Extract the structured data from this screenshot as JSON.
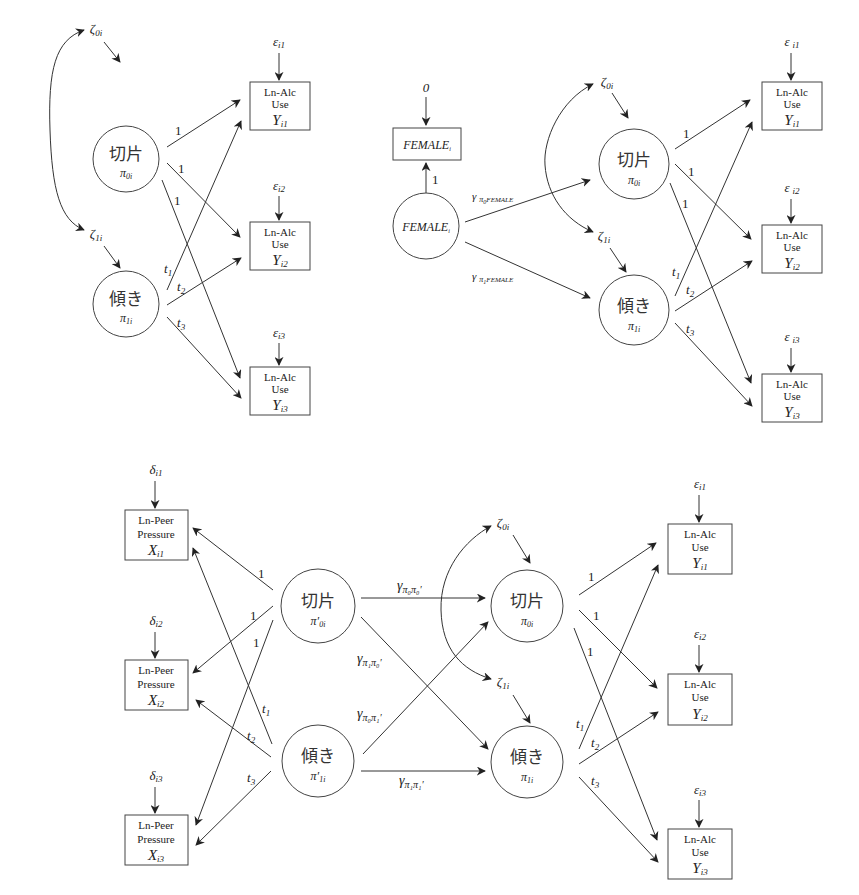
{
  "figure": {
    "panels": [
      {
        "id": "unconditional",
        "latents": [
          {
            "id": "intercept",
            "label": "切片",
            "symbol": "π",
            "sub": "0i",
            "disturbance": {
              "symbol": "ζ",
              "sub": "0i"
            }
          },
          {
            "id": "slope",
            "label": "傾き",
            "symbol": "π",
            "sub": "1i",
            "disturbance": {
              "symbol": "ζ",
              "sub": "1i"
            }
          }
        ],
        "observed": [
          {
            "id": "y1",
            "lines": [
              "Ln-Alc",
              "Use"
            ],
            "symbol": "Y",
            "sub": "i1",
            "error": {
              "symbol": "ε",
              "sub": "i1"
            }
          },
          {
            "id": "y2",
            "lines": [
              "Ln-Alc",
              "Use"
            ],
            "symbol": "Y",
            "sub": "i2",
            "error": {
              "symbol": "ε",
              "sub": "i2"
            }
          },
          {
            "id": "y3",
            "lines": [
              "Ln-Alc",
              "Use"
            ],
            "symbol": "Y",
            "sub": "i3",
            "error": {
              "symbol": "ε",
              "sub": "i3"
            }
          }
        ],
        "loadings": {
          "intercept": [
            "1",
            "1",
            "1"
          ],
          "slope": [
            {
              "symbol": "t",
              "sub": "1"
            },
            {
              "symbol": "t",
              "sub": "2"
            },
            {
              "symbol": "t",
              "sub": "3"
            }
          ]
        }
      },
      {
        "id": "female-predictor",
        "predictor": {
          "observed": {
            "label": "FEMALE",
            "sub": "i",
            "error_value": "0"
          },
          "latent": {
            "label": "FEMALE",
            "sub": "i"
          },
          "loading": "1"
        },
        "paths": [
          {
            "symbol": "γ",
            "sub": "π₀FEMALE",
            "sub_main": "π",
            "sub_idx": "0",
            "sub_tail": "FEMALE"
          },
          {
            "symbol": "γ",
            "sub": "π₁FEMALE",
            "sub_main": "π",
            "sub_idx": "1",
            "sub_tail": "FEMALE"
          }
        ],
        "latents": [
          {
            "id": "intercept",
            "label": "切片",
            "symbol": "π",
            "sub": "0i",
            "disturbance": {
              "symbol": "ζ",
              "sub": "0i"
            }
          },
          {
            "id": "slope",
            "label": "傾き",
            "symbol": "π",
            "sub": "1i",
            "disturbance": {
              "symbol": "ζ",
              "sub": "1i"
            }
          }
        ],
        "observed": [
          {
            "id": "y1",
            "lines": [
              "Ln-Alc",
              "Use"
            ],
            "symbol": "Y",
            "sub": "i1",
            "error": {
              "symbol": "ε",
              "sub": "i1"
            }
          },
          {
            "id": "y2",
            "lines": [
              "Ln-Alc",
              "Use"
            ],
            "symbol": "Y",
            "sub": "i2",
            "error": {
              "symbol": "ε",
              "sub": "i2"
            }
          },
          {
            "id": "y3",
            "lines": [
              "Ln-Alc",
              "Use"
            ],
            "symbol": "Y",
            "sub": "i3",
            "error": {
              "symbol": "ε",
              "sub": "i3"
            }
          }
        ],
        "loadings": {
          "intercept": [
            "1",
            "1",
            "1"
          ],
          "slope": [
            {
              "symbol": "t",
              "sub": "1"
            },
            {
              "symbol": "t",
              "sub": "2"
            },
            {
              "symbol": "t",
              "sub": "3"
            }
          ]
        }
      },
      {
        "id": "cross-process",
        "x_observed": [
          {
            "id": "x1",
            "lines": [
              "Ln-Peer",
              "Pressure"
            ],
            "symbol": "X",
            "sub": "i1",
            "error": {
              "symbol": "δ",
              "sub": "i1"
            }
          },
          {
            "id": "x2",
            "lines": [
              "Ln-Peer",
              "Pressure"
            ],
            "symbol": "X",
            "sub": "i2",
            "error": {
              "symbol": "δ",
              "sub": "i2"
            }
          },
          {
            "id": "x3",
            "lines": [
              "Ln-Peer",
              "Pressure"
            ],
            "symbol": "X",
            "sub": "i3",
            "error": {
              "symbol": "δ",
              "sub": "i3"
            }
          }
        ],
        "x_latents": [
          {
            "id": "x-intercept",
            "label": "切片",
            "symbol": "π′",
            "sub": "0i"
          },
          {
            "id": "x-slope",
            "label": "傾き",
            "symbol": "π′",
            "sub": "1i"
          }
        ],
        "y_latents": [
          {
            "id": "intercept",
            "label": "切片",
            "symbol": "π",
            "sub": "0i",
            "disturbance": {
              "symbol": "ζ",
              "sub": "0i"
            }
          },
          {
            "id": "slope",
            "label": "傾き",
            "symbol": "π",
            "sub": "1i",
            "disturbance": {
              "symbol": "ζ",
              "sub": "1i"
            }
          }
        ],
        "structural_paths": [
          {
            "from": "x-intercept",
            "to": "intercept",
            "symbol": "γ",
            "sub": "π₀π₀′"
          },
          {
            "from": "x-intercept",
            "to": "slope",
            "symbol": "γ",
            "sub": "π₁π₀′"
          },
          {
            "from": "x-slope",
            "to": "intercept",
            "symbol": "γ",
            "sub": "π₀π₁′"
          },
          {
            "from": "x-slope",
            "to": "slope",
            "symbol": "γ",
            "sub": "π₁π₁′"
          }
        ],
        "y_observed": [
          {
            "id": "y1",
            "lines": [
              "Ln-Alc",
              "Use"
            ],
            "symbol": "Y",
            "sub": "i1",
            "error": {
              "symbol": "ε",
              "sub": "i1"
            }
          },
          {
            "id": "y2",
            "lines": [
              "Ln-Alc",
              "Use"
            ],
            "symbol": "Y",
            "sub": "i2",
            "error": {
              "symbol": "ε",
              "sub": "i2"
            }
          },
          {
            "id": "y3",
            "lines": [
              "Ln-Alc",
              "Use"
            ],
            "symbol": "Y",
            "sub": "i3",
            "error": {
              "symbol": "ε",
              "sub": "i3"
            }
          }
        ],
        "loadings": {
          "intercept": [
            "1",
            "1",
            "1"
          ],
          "slope": [
            {
              "symbol": "t",
              "sub": "1"
            },
            {
              "symbol": "t",
              "sub": "2"
            },
            {
              "symbol": "t",
              "sub": "3"
            }
          ]
        }
      }
    ]
  }
}
